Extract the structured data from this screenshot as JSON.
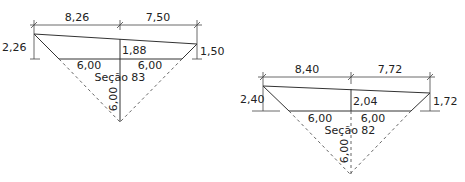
{
  "sections": [
    {
      "label": "Seção 83",
      "top_left_width": "8,26",
      "top_right_width": "7,50",
      "left_height": "2,26",
      "center_height": "1,88",
      "right_height": "1,50",
      "bottom_left_width": "6,00",
      "bottom_right_width": "6,00",
      "depth": "6,00"
    },
    {
      "label": "Seção 82",
      "top_left_width": "8,40",
      "top_right_width": "7,72",
      "left_height": "2,40",
      "center_height": "2,04",
      "right_height": "1,72",
      "bottom_left_width": "6,00",
      "bottom_right_width": "6,00",
      "depth": "6,00"
    }
  ],
  "colors": {
    "line": "#333333",
    "background": "#ffffff"
  }
}
